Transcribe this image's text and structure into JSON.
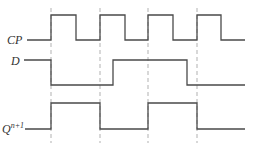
{
  "diagram": {
    "type": "timing-diagram",
    "colors": {
      "signal": "#4a4a4a",
      "guide": "#a8a8a8",
      "label": "#333333"
    },
    "clock_edges_x": [
      51,
      100,
      148,
      197
    ],
    "signals": [
      {
        "name": "CP",
        "label": "CP",
        "label_sup": "",
        "label_x": 7,
        "label_y": 44,
        "high_y": 15,
        "low_y": 40,
        "points": "27,40 51,40 51,15 76,15 76,40 100,40 100,15 125,15 125,40 148,40 148,15 173,15 173,40 197,40 197,15 221,15 221,40 245,40",
        "levels": [
          0,
          1,
          0,
          1,
          0,
          1,
          0,
          1,
          0
        ]
      },
      {
        "name": "D",
        "label": "D",
        "label_sup": "",
        "label_x": 11,
        "label_y": 65,
        "high_y": 60,
        "low_y": 85,
        "points": "24,60 51,60 51,85 113,85 113,60 187,60 187,85 245,85",
        "levels": [
          1,
          0,
          1,
          0
        ]
      },
      {
        "name": "Q",
        "label": "Q",
        "label_sup": "n+1",
        "label_x": 2,
        "label_y": 133,
        "high_y": 103,
        "low_y": 129,
        "points": "25,129 51,129 51,103 100,103 100,129 148,129 148,103 197,103 197,129 245,129",
        "levels": [
          0,
          1,
          0,
          1,
          0
        ]
      }
    ]
  }
}
